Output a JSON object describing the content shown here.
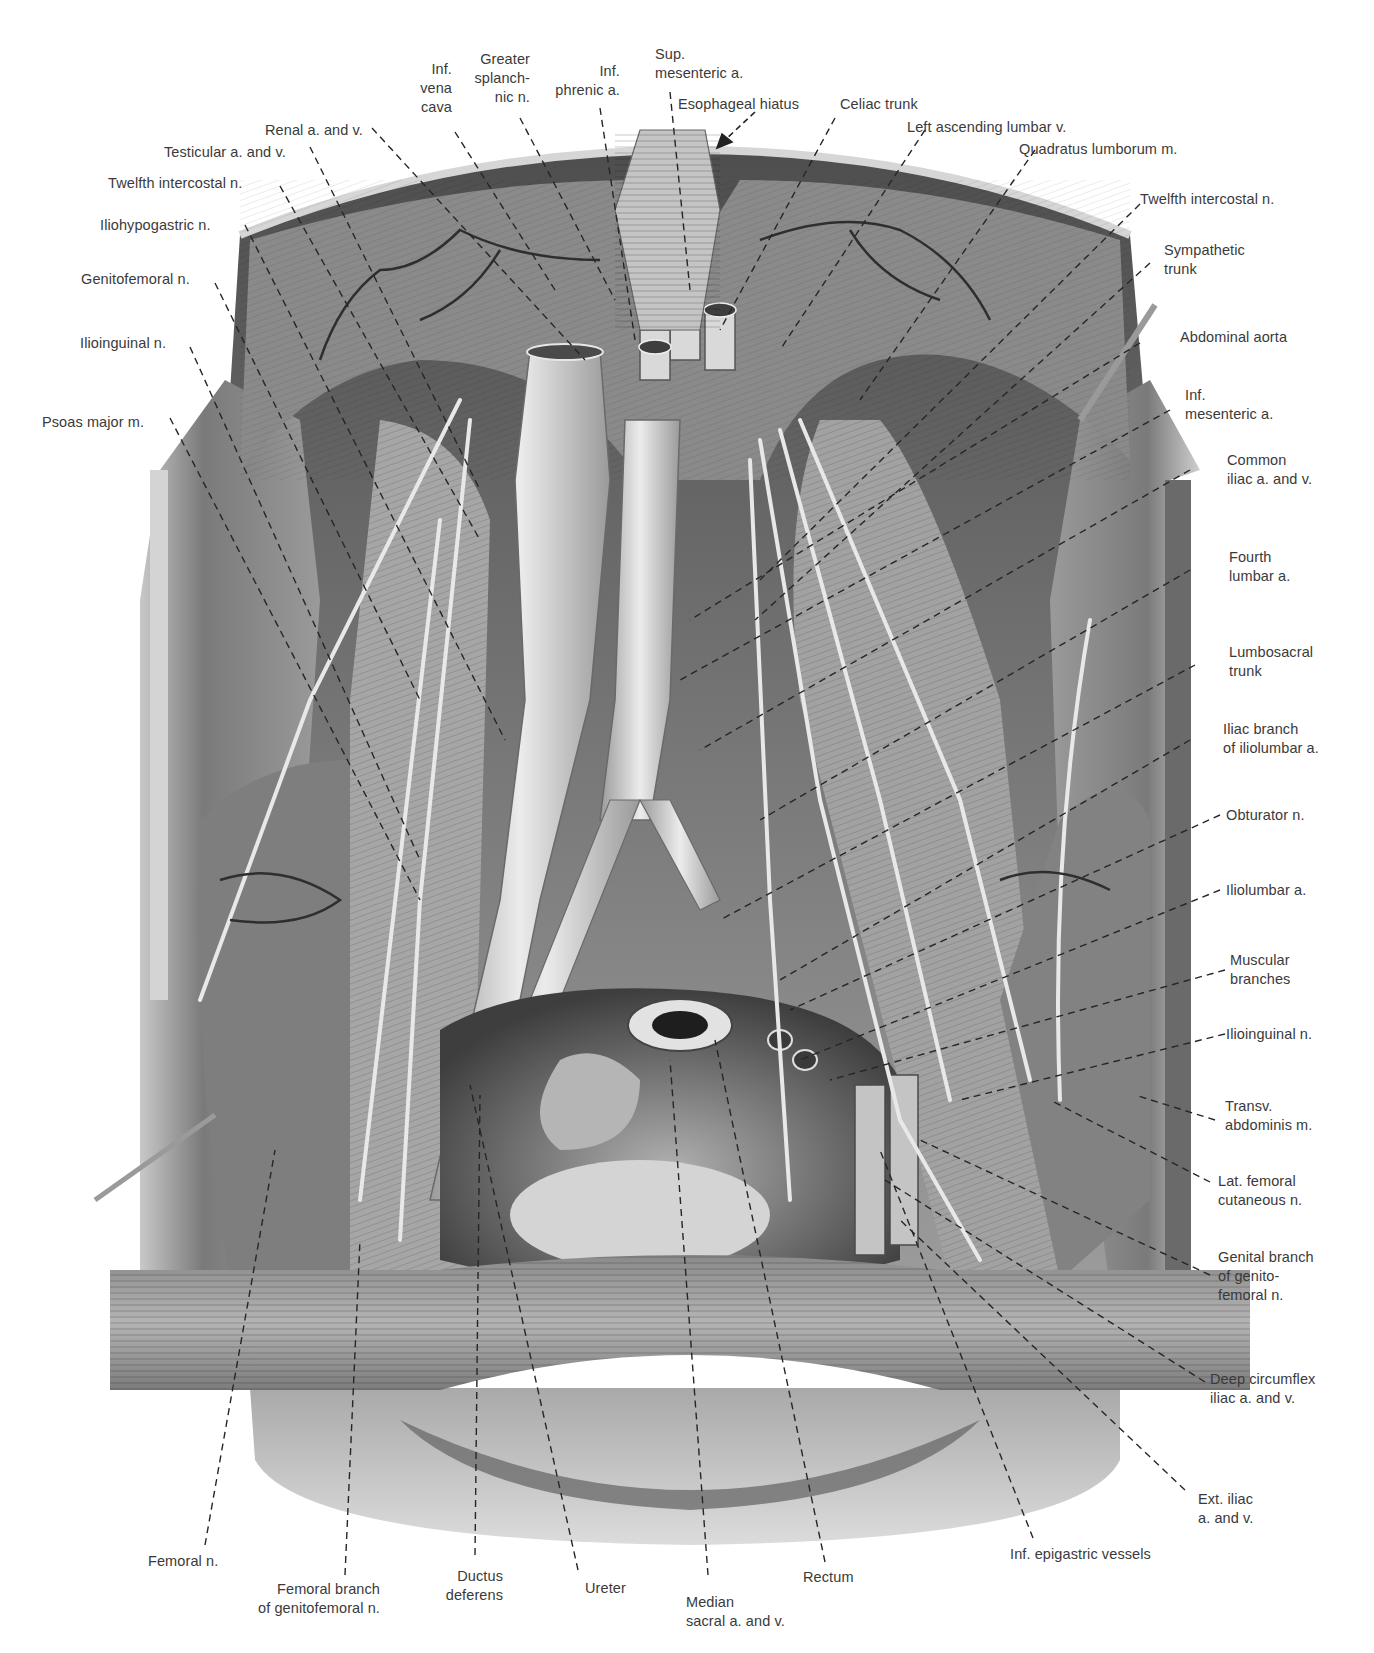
{
  "figure": {
    "palette": {
      "background": "#ffffff",
      "label_text": "#3a3a3a",
      "leader_line": "#2a2a2a",
      "muscle_dark": "#5a5a5a",
      "muscle_mid": "#8e8e8e",
      "muscle_light": "#c9c9c9",
      "vessel": "#d8d8d8",
      "skin": "#bdbdbd"
    }
  },
  "labels": {
    "top": {
      "inf_vena_cava": "Inf.\nvena\ncava",
      "greater_splanchnic_n": "Greater\nsplanch-\nnic n.",
      "inf_phrenic_a": "Inf.\nphrenic a.",
      "sup_mesenteric_a": "Sup.\nmesenteric a.",
      "esophageal_hiatus": "Esophageal hiatus",
      "celiac_trunk": "Celiac trunk",
      "left_ascending_lumbar_v": "Left ascending lumbar v.",
      "quadratus_lumborum_m": "Quadratus lumborum m."
    },
    "left": {
      "renal_a_and_v": "Renal a. and v.",
      "testicular_a_and_v": "Testicular a. and v.",
      "twelfth_intercostal_n": "Twelfth intercostal n.",
      "iliohypogastric_n": "Iliohypogastric n.",
      "genitofemoral_n": "Genitofemoral n.",
      "ilioinguinal_n": "Ilioinguinal n.",
      "psoas_major_m": "Psoas major m."
    },
    "right": {
      "twelfth_intercostal_n": "Twelfth intercostal n.",
      "sympathetic_trunk": "Sympathetic\ntrunk",
      "abdominal_aorta": "Abdominal aorta",
      "inf_mesenteric_a": "Inf.\nmesenteric a.",
      "common_iliac_a_and_v": "Common\niliac a. and v.",
      "fourth_lumbar_a": "Fourth\nlumbar a.",
      "lumbosacral_trunk": "Lumbosacral\ntrunk",
      "iliac_branch_of_iliolumbar_a": "Iliac branch\nof iliolumbar a.",
      "obturator_n": "Obturator n.",
      "iliolumbar_a": "Iliolumbar a.",
      "muscular_branches": "Muscular\nbranches",
      "ilioinguinal_n": "Ilioinguinal n.",
      "transv_abdominis_m": "Transv.\nabdominis m.",
      "lat_femoral_cutaneous_n": "Lat. femoral\ncutaneous n.",
      "genital_branch_of_genitofemoral_n": "Genital branch\nof genito-\nfemoral n.",
      "deep_circumflex_iliac_a_and_v": "Deep circumflex\niliac a. and v.",
      "ext_iliac_a_and_v": "Ext. iliac\na. and v."
    },
    "bottom": {
      "femoral_n": "Femoral n.",
      "femoral_branch_of_genitofemoral_n": "Femoral branch\nof genitofemoral n.",
      "ductus_deferens": "Ductus\ndeferens",
      "ureter": "Ureter",
      "median_sacral_a_and_v": "Median\nsacral a. and v.",
      "rectum": "Rectum",
      "inf_epigastric_vessels": "Inf. epigastric vessels"
    }
  }
}
